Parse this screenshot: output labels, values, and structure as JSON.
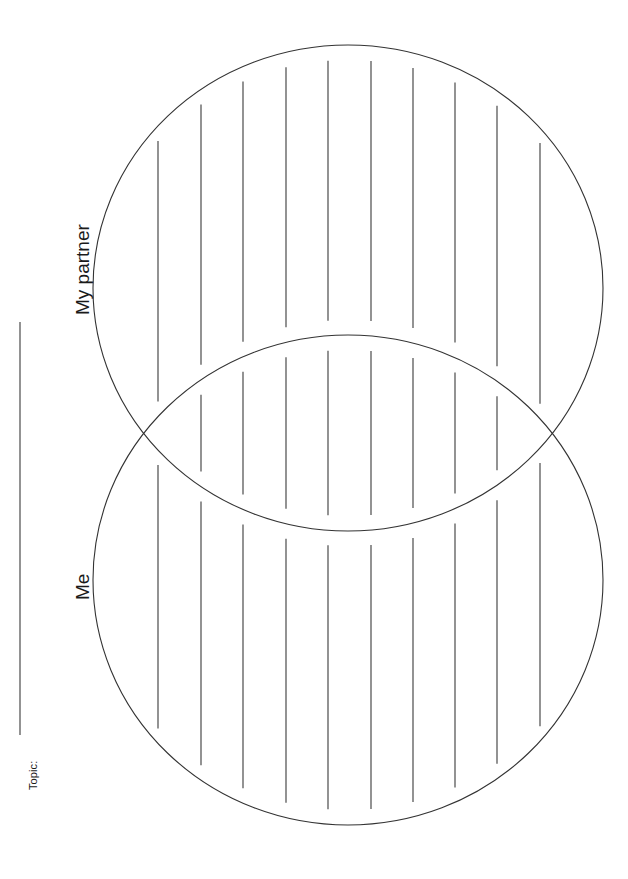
{
  "page": {
    "background_color": "#ffffff",
    "ink_color": "#333333",
    "width": 628,
    "height": 879,
    "orientation": "rotated-90-counterclockwise"
  },
  "topic_field": {
    "label": "Topic:",
    "value": "",
    "rule_line": {
      "orientation": "vertical-on-screen",
      "x": 20,
      "y_start": 322,
      "y_end": 735,
      "color": "#3a3a3a"
    }
  },
  "diagram": {
    "type": "venn-two-circle",
    "stroke_color": "#333333",
    "stroke_width": 1.1,
    "circles": [
      {
        "id": "partner",
        "label": "My partner",
        "cx": 348,
        "cy": 288,
        "rx": 255,
        "ry": 243
      },
      {
        "id": "me",
        "label": "Me",
        "cx": 348,
        "cy": 580,
        "rx": 255,
        "ry": 245
      }
    ],
    "intersection_points": [
      {
        "x": 140,
        "y": 435
      },
      {
        "x": 556,
        "y": 437
      }
    ],
    "writing_lines": {
      "orientation": "vertical-on-screen",
      "count_per_band": 10,
      "x_positions": [
        158,
        201,
        243,
        286,
        328,
        371,
        413,
        455,
        497,
        540
      ],
      "inset_from_arc": 15,
      "color": "#3a3a3a",
      "stroke_width": 1.1,
      "bands": [
        {
          "id": "partner-only",
          "region": "top-circle-above-intersection"
        },
        {
          "id": "overlap",
          "region": "lens-intersection"
        },
        {
          "id": "me-only",
          "region": "bottom-circle-below-intersection"
        }
      ]
    }
  },
  "labels": {
    "partner": "My partner",
    "me": "Me",
    "topic": "Topic:"
  }
}
